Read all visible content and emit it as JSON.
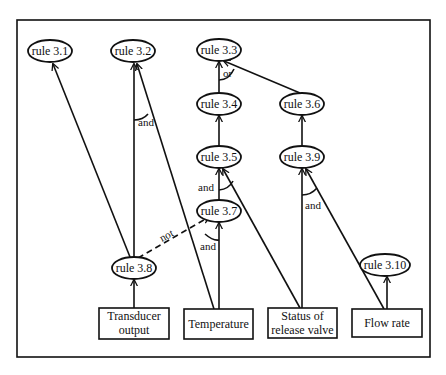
{
  "diagram": {
    "type": "inference-network",
    "frame": {
      "x": 17,
      "y": 20,
      "w": 413,
      "h": 337
    },
    "rules": [
      {
        "id": "r31",
        "label": "rule 3.1",
        "cx": 50,
        "cy": 51
      },
      {
        "id": "r32",
        "label": "rule 3.2",
        "cx": 133,
        "cy": 51
      },
      {
        "id": "r33",
        "label": "rule 3.3",
        "cx": 219,
        "cy": 50
      },
      {
        "id": "r34",
        "label": "rule 3.4",
        "cx": 219,
        "cy": 104
      },
      {
        "id": "r36",
        "label": "rule 3.6",
        "cx": 302,
        "cy": 104
      },
      {
        "id": "r35",
        "label": "rule 3.5",
        "cx": 219,
        "cy": 157
      },
      {
        "id": "r39",
        "label": "rule 3.9",
        "cx": 302,
        "cy": 157
      },
      {
        "id": "r37",
        "label": "rule 3.7",
        "cx": 219,
        "cy": 211
      },
      {
        "id": "r38",
        "label": "rule 3.8",
        "cx": 134,
        "cy": 268
      },
      {
        "id": "r310",
        "label": "rule 3.10",
        "cx": 385,
        "cy": 265
      }
    ],
    "inputs": [
      {
        "id": "transducer",
        "lines": [
          "Transducer",
          "output"
        ],
        "x": 99,
        "y": 308,
        "w": 70,
        "h": 31
      },
      {
        "id": "temperature",
        "lines": [
          "Temperature"
        ],
        "x": 184,
        "y": 309,
        "w": 69,
        "h": 30
      },
      {
        "id": "valve",
        "lines": [
          "Status of",
          "release valve"
        ],
        "x": 268,
        "y": 308,
        "w": 69,
        "h": 30
      },
      {
        "id": "flow",
        "lines": [
          "Flow rate"
        ],
        "x": 352,
        "y": 309,
        "w": 70,
        "h": 28
      }
    ],
    "connectors": [
      {
        "id": "and-32",
        "label": "and",
        "x": 138,
        "y": 126
      },
      {
        "id": "or-33",
        "label": "or",
        "x": 223,
        "y": 77
      },
      {
        "id": "and-35",
        "label": "and",
        "x": 198,
        "y": 191
      },
      {
        "id": "and-37",
        "label": "and",
        "x": 200,
        "y": 250
      },
      {
        "id": "not-38",
        "label": "not",
        "x": 162,
        "y": 242
      },
      {
        "id": "and-39",
        "label": "and",
        "x": 305,
        "y": 209
      }
    ]
  }
}
